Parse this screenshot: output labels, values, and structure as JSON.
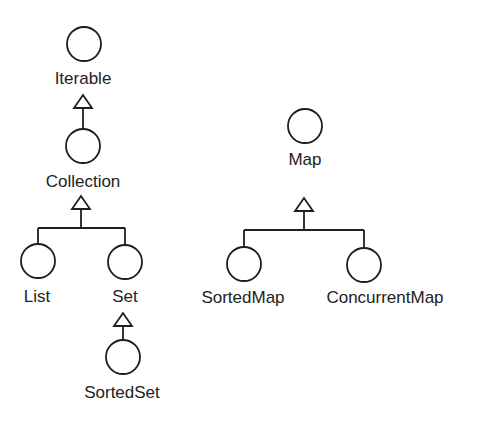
{
  "diagram": {
    "type": "interface-inheritance-tree",
    "colors": {
      "stroke": "#1e1e1e",
      "text": "#222222",
      "background": "#ffffff"
    },
    "nodes": {
      "iterable": {
        "label": "Iterable"
      },
      "collection": {
        "label": "Collection"
      },
      "list": {
        "label": "List"
      },
      "set": {
        "label": "Set"
      },
      "sortedset": {
        "label": "SortedSet"
      },
      "map": {
        "label": "Map"
      },
      "sortedmap": {
        "label": "SortedMap"
      },
      "concurrentmap": {
        "label": "ConcurrentMap"
      }
    },
    "edges": [
      {
        "from": "collection",
        "to": "iterable",
        "kind": "extends"
      },
      {
        "from": "list",
        "to": "collection",
        "kind": "extends"
      },
      {
        "from": "set",
        "to": "collection",
        "kind": "extends"
      },
      {
        "from": "sortedset",
        "to": "set",
        "kind": "extends"
      },
      {
        "from": "sortedmap",
        "to": "map",
        "kind": "extends"
      },
      {
        "from": "concurrentmap",
        "to": "map",
        "kind": "extends"
      }
    ]
  }
}
